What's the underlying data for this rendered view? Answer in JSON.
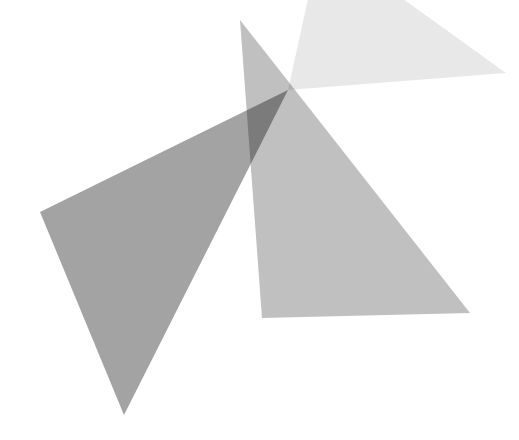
{
  "canvas": {
    "width": 519,
    "height": 440,
    "background_color": "#ffffff",
    "title": "Overlapping Translucent Triangles",
    "blend_mode": "multiply"
  },
  "palette": {
    "background": "#ffffff",
    "triangle_dark_fill": "#808080",
    "triangle_medium_fill": "#b3b3b3",
    "triangle_light_fill": "#e8e8e8",
    "observed_dark_solid": "#939393",
    "observed_medium_solid": "#c8c8c8",
    "observed_light_solid": "#f2f2f2",
    "observed_darkest_overlap": "#7a7a7a",
    "observed_mid_overlap": "#a0a0a0"
  },
  "shapes": [
    {
      "id": "triangle-light",
      "name": "light-gray-triangle",
      "label": "Light gray triangle (upper right, clipped at top edge)",
      "fill": "#e8e8e8",
      "opacity": 1,
      "z_order": 1,
      "points": "288,90 321,-60 506,73"
    },
    {
      "id": "triangle-medium",
      "name": "medium-gray-triangle",
      "label": "Medium gray triangle (center, pointing up)",
      "fill": "#c0c0c0",
      "opacity": 1,
      "z_order": 2,
      "points": "240,20 262,318 470,313"
    },
    {
      "id": "triangle-dark",
      "name": "dark-gray-triangle",
      "label": "Dark gray triangle (left, pointing down)",
      "fill": "#8f8f8f",
      "opacity": 0.82,
      "z_order": 3,
      "points": "40,212 288,90 124,415"
    }
  ],
  "vertices": {
    "triangle_light": [
      {
        "name": "apex-lower-left",
        "x": 288,
        "y": 90
      },
      {
        "name": "top-clipped-left",
        "x": 321,
        "y": -60
      },
      {
        "name": "right-corner",
        "x": 506,
        "y": 73
      }
    ],
    "triangle_medium": [
      {
        "name": "apex-top",
        "x": 240,
        "y": 20
      },
      {
        "name": "bottom-left",
        "x": 262,
        "y": 318
      },
      {
        "name": "bottom-right",
        "x": 470,
        "y": 313
      }
    ],
    "triangle_dark": [
      {
        "name": "left-corner",
        "x": 40,
        "y": 212
      },
      {
        "name": "upper-right",
        "x": 288,
        "y": 90
      },
      {
        "name": "bottom-apex",
        "x": 124,
        "y": 415
      }
    ]
  }
}
